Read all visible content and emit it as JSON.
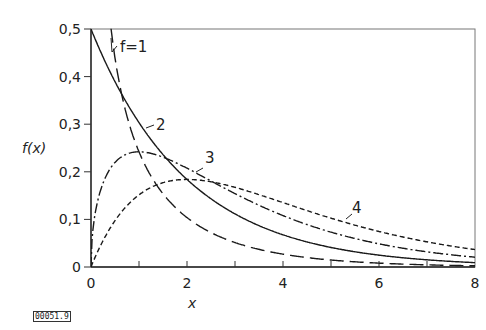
{
  "figure_id": "00051.9",
  "chart_data": {
    "type": "line",
    "title": "",
    "xlabel": "x",
    "ylabel": "f(x)",
    "xlim": [
      0,
      8
    ],
    "ylim": [
      0,
      0.5
    ],
    "grid": false,
    "legend": "inline curve labels",
    "x_ticks": [
      0,
      2,
      4,
      6,
      8
    ],
    "x_tick_labels": [
      "0",
      "2",
      "4",
      "6",
      "8"
    ],
    "x_minor_ticks": [
      1,
      3,
      5,
      7
    ],
    "y_ticks": [
      0,
      0.1,
      0.2,
      0.3,
      0.4,
      0.5
    ],
    "y_tick_labels": [
      "0",
      "0,1",
      "0,2",
      "0,3",
      "0,4",
      "0,5"
    ],
    "series": [
      {
        "name": "f=1",
        "label": "f=1",
        "style": "long-dash",
        "x": [
          0.1,
          0.2,
          0.3,
          0.5,
          0.75,
          1,
          1.5,
          2,
          3,
          4,
          5,
          6,
          7,
          8
        ],
        "values": [
          1.2,
          0.807,
          0.627,
          0.439,
          0.317,
          0.242,
          0.154,
          0.104,
          0.051,
          0.027,
          0.015,
          0.008,
          0.005,
          0.003
        ]
      },
      {
        "name": "f=2",
        "label": "2",
        "style": "solid",
        "x": [
          0,
          0.5,
          1,
          1.5,
          2,
          3,
          4,
          5,
          6,
          7,
          8
        ],
        "values": [
          0.5,
          0.389,
          0.303,
          0.236,
          0.184,
          0.112,
          0.068,
          0.041,
          0.025,
          0.015,
          0.009
        ]
      },
      {
        "name": "f=3",
        "label": "3",
        "style": "dash-dot",
        "x": [
          0,
          0.25,
          0.5,
          1,
          1.5,
          2,
          3,
          4,
          5,
          6,
          7,
          8
        ],
        "values": [
          0,
          0.176,
          0.219,
          0.242,
          0.231,
          0.208,
          0.154,
          0.108,
          0.073,
          0.048,
          0.032,
          0.021
        ]
      },
      {
        "name": "f=4",
        "label": "4",
        "style": "short-dash",
        "x": [
          0,
          0.5,
          1,
          1.5,
          2,
          3,
          4,
          5,
          6,
          7,
          8
        ],
        "values": [
          0,
          0.097,
          0.152,
          0.177,
          0.184,
          0.167,
          0.135,
          0.103,
          0.075,
          0.053,
          0.037
        ]
      }
    ],
    "annotations": [
      {
        "text": "f=1",
        "x": 0.95,
        "y": 0.45
      },
      {
        "text": "2",
        "x": 1.3,
        "y": 0.28
      },
      {
        "text": "3",
        "x": 2.4,
        "y": 0.215
      },
      {
        "text": "4",
        "x": 5.5,
        "y": 0.115
      }
    ]
  }
}
